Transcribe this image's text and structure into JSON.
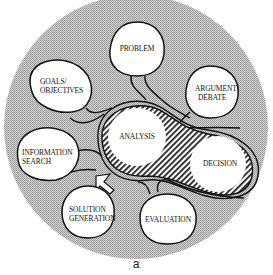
{
  "diagram": {
    "type": "concept-bubble-diagram",
    "background_color": "#bdbdbd",
    "bubble_fill": "#ffffff",
    "outline_color": "#111111",
    "center_cluster": {
      "style": "hatched",
      "nodes": [
        {
          "id": "analysis",
          "label": "ANALYSIS"
        },
        {
          "id": "decision",
          "label": "DECISION"
        }
      ]
    },
    "nodes": [
      {
        "id": "problem",
        "lines": [
          "PROBLEM"
        ]
      },
      {
        "id": "goals",
        "lines": [
          "GOALS/",
          "OBJECTIVES"
        ]
      },
      {
        "id": "argument",
        "lines": [
          "ARGUMENT/",
          "DEBATE"
        ]
      },
      {
        "id": "information",
        "lines": [
          "INFORMATION",
          "SEARCH"
        ]
      },
      {
        "id": "solution",
        "lines": [
          "SOLUTION",
          "GENERATION"
        ]
      },
      {
        "id": "evaluation",
        "lines": [
          "EVALUATION"
        ]
      }
    ],
    "caption": "a"
  }
}
